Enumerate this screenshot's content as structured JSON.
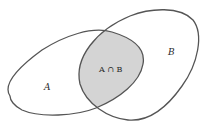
{
  "diagram": {
    "type": "venn",
    "colors": {
      "outline": "#555555",
      "intersection_fill": "#d4d4d4",
      "background": "#ffffff"
    },
    "sets": [
      {
        "id": "A",
        "label": "A"
      },
      {
        "id": "B",
        "label": "B"
      }
    ],
    "intersection": {
      "label": "A ∩ B",
      "shaded": true
    }
  }
}
